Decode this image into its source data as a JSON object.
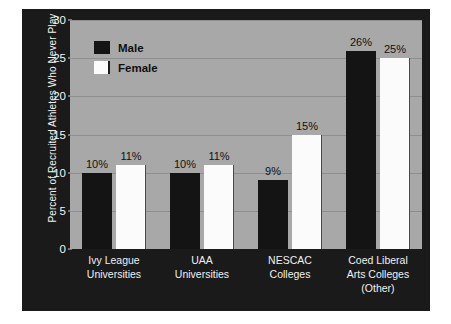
{
  "chart_data": {
    "type": "bar",
    "title": "",
    "xlabel": "",
    "ylabel": "Percent of Recruited Athletes Who Never Play",
    "ylim": [
      0,
      30
    ],
    "yticks": [
      0,
      5,
      10,
      15,
      20,
      25,
      30
    ],
    "grid": true,
    "legend_position": "upper-left-inside",
    "categories": [
      "Ivy League\nUniversities",
      "UAA\nUniversities",
      "NESCAC\nColleges",
      "Coed Liberal\nArts Colleges\n(Other)"
    ],
    "series": [
      {
        "name": "Male",
        "values": [
          10,
          10,
          9,
          26
        ],
        "labels": [
          "10%",
          "10%",
          "9%",
          "26%"
        ],
        "color": "#141414"
      },
      {
        "name": "Female",
        "values": [
          11,
          11,
          15,
          25
        ],
        "labels": [
          "11%",
          "11%",
          "15%",
          "25%"
        ],
        "color": "#fbfbfb"
      }
    ]
  },
  "axis": {
    "y_title": "Percent of Recruited Athletes Who Never Play",
    "tick_labels": [
      "0",
      "5",
      "10",
      "15",
      "20",
      "25",
      "30"
    ]
  },
  "legend": {
    "items": [
      {
        "label": "Male",
        "swatch": "black-square-swatch"
      },
      {
        "label": "Female",
        "swatch": "white-square-swatch"
      }
    ]
  },
  "categories": [
    {
      "line1": "Ivy League",
      "line2": "Universities",
      "line3": ""
    },
    {
      "line1": "UAA",
      "line2": "Universities",
      "line3": ""
    },
    {
      "line1": "NESCAC",
      "line2": "Colleges",
      "line3": ""
    },
    {
      "line1": "Coed Liberal",
      "line2": "Arts Colleges",
      "line3": "(Other)"
    }
  ],
  "bar_labels": {
    "g0_male": "10%",
    "g0_female": "11%",
    "g1_male": "10%",
    "g1_female": "11%",
    "g2_male": "9%",
    "g2_female": "15%",
    "g3_male": "26%",
    "g3_female": "25%"
  },
  "colors": {
    "male_bar": "#141414",
    "female_bar": "#fbfbfb",
    "plot_background": "#a8a8a8",
    "frame": "#1a1a1a",
    "gridline": "#8f8f8f"
  }
}
